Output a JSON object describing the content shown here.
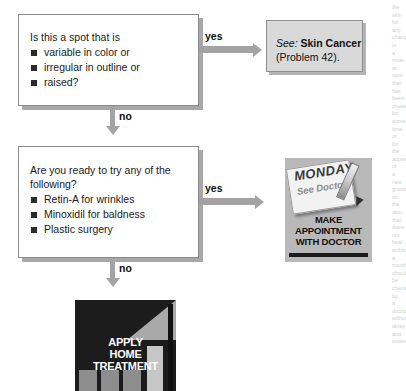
{
  "page": {
    "width": 406,
    "height": 391,
    "background": "#ffffff",
    "type": "flowchart"
  },
  "nodes": {
    "question1": {
      "lead": "Is this a spot that is",
      "bullets": [
        "variable in color or",
        "irregular in outline or",
        "raised?"
      ]
    },
    "question2": {
      "lead": "Are you ready to try any of the following?",
      "bullets": [
        "Retin-A for wrinkles",
        "Minoxidil for baldness",
        "Plastic surgery"
      ]
    },
    "reference1": {
      "see_label": "See:",
      "topic": "Skin Cancer",
      "problem": "(Problem 42)."
    },
    "action_doctor": {
      "calendar_day": "MONDAY",
      "calendar_note": "See Doctor",
      "caption_line1": "MAKE",
      "caption_line2": "APPOINTMENT",
      "caption_line3": "WITH DOCTOR"
    },
    "action_home": {
      "caption_line1": "APPLY",
      "caption_line2": "HOME",
      "caption_line3": "TREATMENT"
    }
  },
  "edges": {
    "q1_yes": "yes",
    "q1_no": "no",
    "q2_yes": "yes",
    "q2_no": "no"
  },
  "bleed_text": {
    "lines": [
      "the",
      "skin",
      "for",
      "any",
      "change",
      "in",
      "a",
      "mole",
      "or",
      "spot",
      "that",
      "has",
      "been",
      "present",
      "for",
      "some",
      "time",
      "or",
      "for",
      "the",
      "appearance",
      "of",
      "a",
      "new",
      "growth",
      "on",
      "the",
      "skin",
      "that",
      "does",
      "not",
      "heal",
      "within",
      "a",
      "month",
      "should",
      "be",
      "checked",
      "by",
      "a",
      "doctor",
      "without",
      "delay",
      "and",
      "treated"
    ]
  },
  "colors": {
    "connector": "#a3a3a3",
    "box_border": "#8b8b8b",
    "box_shadow": "#a8a8a8",
    "ref_fill": "#d9d9d9",
    "text": "#1a1a1a",
    "photo_dark": "#1c1c1c"
  }
}
